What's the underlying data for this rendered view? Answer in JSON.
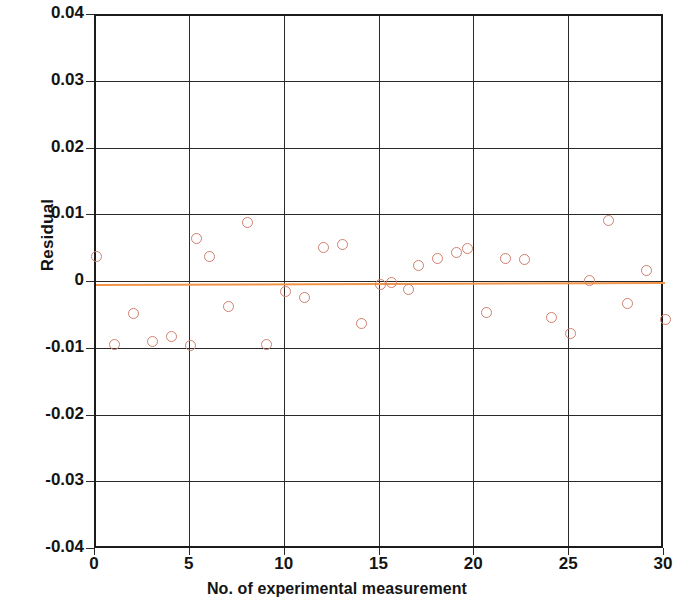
{
  "chart_data": {
    "type": "scatter",
    "title": "",
    "xlabel": "No. of experimental measurement",
    "ylabel": "Residual",
    "xlim": [
      0,
      30
    ],
    "ylim": [
      -0.04,
      0.04
    ],
    "xticks": [
      "0",
      "5",
      "10",
      "15",
      "20",
      "25",
      "30"
    ],
    "xtick_values": [
      0,
      5,
      10,
      15,
      20,
      25,
      30
    ],
    "yticks": [
      "0.04",
      "0.03",
      "0.02",
      "0.01",
      "0",
      "-0.01",
      "-0.02",
      "-0.03",
      "-0.04"
    ],
    "ytick_values": [
      0.04,
      0.03,
      0.02,
      0.01,
      0,
      -0.01,
      -0.02,
      -0.03,
      -0.04
    ],
    "grid": true,
    "legend": "none",
    "marker_style": "open-circle",
    "marker_color": "#d07f6e",
    "reference_line": {
      "label": "zero residual line",
      "color": "#f0954a",
      "y_start": -0.0001,
      "y_end": 0.0002
    },
    "series": [
      {
        "name": "Residual",
        "x": [
          0,
          1,
          2,
          3,
          4,
          5,
          5.3,
          6,
          7,
          8,
          9,
          10,
          11,
          12,
          13,
          14,
          15,
          15.6,
          16.5,
          17,
          18,
          19,
          19.6,
          20.6,
          21.6,
          22.6,
          24,
          25,
          26,
          27,
          28,
          29,
          30
        ],
        "y": [
          0.004,
          -0.0092,
          -0.0045,
          -0.0088,
          -0.008,
          -0.0093,
          0.0066,
          0.004,
          -0.0035,
          0.009,
          -0.0092,
          -0.0012,
          -0.0022,
          0.0053,
          0.0057,
          -0.006,
          -0.0002,
          0.0001,
          -0.0009,
          0.0026,
          0.0036,
          0.0046,
          0.0052,
          -0.0044,
          0.0036,
          0.0035,
          -0.0052,
          -0.0075,
          0.0003,
          0.0094,
          -0.003,
          0.0018,
          -0.0055
        ]
      }
    ]
  },
  "axis": {
    "y_title": "Residual",
    "x_title": "No. of experimental measurement"
  }
}
